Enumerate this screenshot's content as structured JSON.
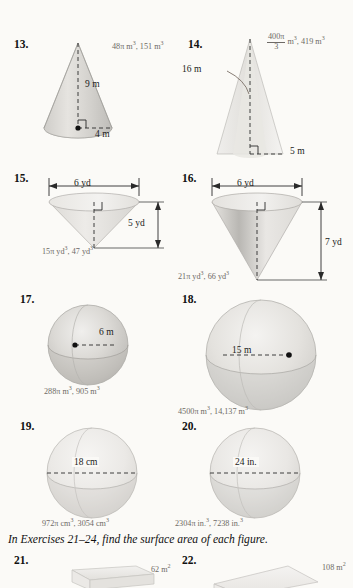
{
  "page": {
    "background_color": "#fbfaf7",
    "text_color": "#1a1a1a",
    "answer_color": "#6e6a66"
  },
  "instruction": {
    "text": "In Exercises 21–24, find the surface area of each figure."
  },
  "exercises": [
    {
      "number": "13.",
      "figure": "cone",
      "labels": {
        "height": "9 m",
        "radius": "4 m"
      },
      "answer": "48π m³, 151 m³",
      "answer_parts": {
        "exact": "48π m",
        "exact_exp": "3",
        "approx": ", 151 m",
        "approx_exp": "3"
      }
    },
    {
      "number": "14.",
      "figure": "cone",
      "labels": {
        "slant": "16 m",
        "radius": "5 m"
      },
      "answer": "400π/3 m³, 419 m³",
      "answer_parts": {
        "frac_top": "400π",
        "frac_bot": "3",
        "unit": " m",
        "unit_exp": "3",
        "approx": ", 419 m",
        "approx_exp": "3"
      }
    },
    {
      "number": "15.",
      "figure": "cone-inverted",
      "labels": {
        "diameter": "6 yd",
        "height": "5 yd"
      },
      "answer": "15π yd³, 47 yd³",
      "answer_parts": {
        "exact": "15π yd",
        "exact_exp": "3",
        "approx": ", 47 yd",
        "approx_exp": "3"
      }
    },
    {
      "number": "16.",
      "figure": "cone-inverted",
      "labels": {
        "diameter": "6 yd",
        "height": "7 yd"
      },
      "answer": "21π yd³, 66 yd³",
      "answer_parts": {
        "exact": "21π yd",
        "exact_exp": "3",
        "approx": ", 66 yd",
        "approx_exp": "3"
      }
    },
    {
      "number": "17.",
      "figure": "sphere",
      "labels": {
        "radius": "6 m"
      },
      "answer": "288π m³, 905 m³",
      "answer_parts": {
        "exact": "288π m",
        "exact_exp": "3",
        "approx": ", 905 m",
        "approx_exp": "3"
      }
    },
    {
      "number": "18.",
      "figure": "sphere",
      "labels": {
        "radius": "15 m"
      },
      "answer": "4500π m³, 14,137 m³",
      "answer_parts": {
        "exact": "4500π m",
        "exact_exp": "3",
        "approx": ", 14,137 m",
        "approx_exp": "3"
      }
    },
    {
      "number": "19.",
      "figure": "sphere",
      "labels": {
        "diameter": "18 cm"
      },
      "answer": "972π cm³, 3054 cm³",
      "answer_parts": {
        "exact": "972π cm",
        "exact_exp": "3",
        "approx": ", 3054 cm",
        "approx_exp": "3"
      }
    },
    {
      "number": "20.",
      "figure": "sphere",
      "labels": {
        "diameter": "24 in."
      },
      "answer": "2304π in.³, 7238 in.³",
      "answer_parts": {
        "exact": "2304π in.",
        "exact_exp": "3",
        "approx": ", 7238 in.",
        "approx_exp": "3"
      }
    },
    {
      "number": "21.",
      "figure": "prism",
      "labels": {},
      "answer": "62 m²",
      "answer_parts": {
        "exact": "62 m",
        "exact_exp": "2"
      }
    },
    {
      "number": "22.",
      "figure": "prism",
      "labels": {},
      "answer": "108 m²",
      "answer_parts": {
        "exact": "108 m",
        "exact_exp": "2"
      }
    }
  ]
}
